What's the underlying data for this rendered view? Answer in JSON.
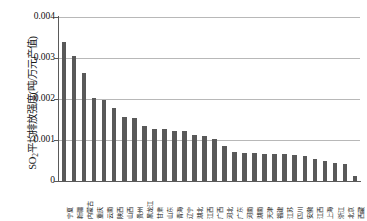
{
  "chart_data": {
    "type": "bar",
    "title": "",
    "xlabel": "",
    "ylabel": "SO2平均排放强度(吨/万元产值)",
    "ylabel_prefix": "SO",
    "ylabel_sub": "2",
    "ylabel_rest": "平均排放强度(吨/万元产值)",
    "ylim": [
      0,
      0.004
    ],
    "yticks": [
      0,
      0.001,
      0.002,
      0.003,
      0.004
    ],
    "ytick_labels": [
      "0",
      "0.001",
      "0.002",
      "0.003",
      "0.004"
    ],
    "grid": true,
    "legend": "none",
    "bar_color": "#595959",
    "categories": [
      "宁夏",
      "新疆",
      "内蒙古",
      "重庆",
      "云南",
      "陕西",
      "山西",
      "贵州",
      "黑龙江",
      "甘肃",
      "山东",
      "青海",
      "辽宁",
      "湖北",
      "江西",
      "广西",
      "河北",
      "广东",
      "河南",
      "湖南",
      "天津",
      "福建",
      "江苏",
      "四川",
      "安徽",
      "江西",
      "上海",
      "浙江",
      "北京",
      "西藏"
    ],
    "values": [
      0.0034,
      0.00305,
      0.00263,
      0.00202,
      0.00197,
      0.00177,
      0.00155,
      0.00153,
      0.00133,
      0.00128,
      0.00126,
      0.00123,
      0.00121,
      0.00112,
      0.00111,
      0.00102,
      0.00085,
      0.0007,
      0.00069,
      0.00068,
      0.00066,
      0.00065,
      0.00065,
      0.00063,
      0.0006,
      0.00054,
      0.00049,
      0.00044,
      0.00042,
      0.00012
    ]
  }
}
